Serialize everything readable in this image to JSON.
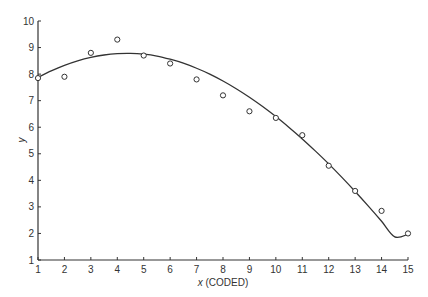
{
  "chart_data": {
    "type": "scatter",
    "title": "",
    "xlabel": "x (CODED)",
    "xlabel_var": "x",
    "xlabel_suffix": "(CODED)",
    "ylabel": "y",
    "xlim": [
      1,
      15
    ],
    "ylim": [
      1,
      10
    ],
    "x_ticks": [
      1,
      2,
      3,
      4,
      5,
      6,
      7,
      8,
      9,
      10,
      11,
      12,
      13,
      14,
      15
    ],
    "y_ticks": [
      1,
      2,
      3,
      4,
      5,
      6,
      7,
      8,
      9,
      10
    ],
    "grid": false,
    "legend": null,
    "series": [
      {
        "name": "observed",
        "kind": "points",
        "marker": "open-circle",
        "x": [
          1,
          2,
          3,
          4,
          5,
          6,
          7,
          8,
          9,
          10,
          11,
          12,
          13,
          14,
          15
        ],
        "y": [
          7.85,
          7.9,
          8.8,
          9.3,
          8.7,
          8.4,
          7.8,
          7.2,
          6.6,
          6.35,
          5.7,
          4.55,
          3.6,
          2.85,
          2.0
        ]
      },
      {
        "name": "fitted curve",
        "kind": "line",
        "x": [
          1,
          1.5,
          2,
          2.5,
          3,
          3.5,
          4,
          4.5,
          5,
          5.5,
          6,
          6.5,
          7,
          7.5,
          8,
          8.5,
          9,
          9.5,
          10,
          10.5,
          11,
          11.5,
          12,
          12.5,
          13,
          13.5,
          14,
          14.5,
          15
        ],
        "y": [
          7.88,
          8.12,
          8.33,
          8.5,
          8.63,
          8.72,
          8.77,
          8.78,
          8.75,
          8.68,
          8.56,
          8.41,
          8.22,
          8.0,
          7.74,
          7.45,
          7.13,
          6.78,
          6.4,
          5.99,
          5.56,
          5.1,
          4.62,
          4.11,
          3.58,
          3.03,
          2.46,
          1.87,
          1.97
        ]
      }
    ]
  }
}
